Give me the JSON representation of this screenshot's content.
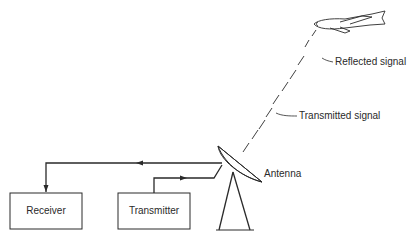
{
  "diagram": {
    "type": "radar-system",
    "blocks": [
      {
        "id": "receiver",
        "label": "Receiver"
      },
      {
        "id": "transmitter",
        "label": "Transmitter"
      }
    ],
    "labels": {
      "antenna": "Antenna",
      "reflected_signal": "Reflected signal",
      "transmitted_signal": "Transmitted signal"
    },
    "icons": [
      "aircraft-icon",
      "antenna-dish-icon"
    ],
    "colors": {
      "line": "#2a2a2a",
      "background": "#ffffff"
    }
  }
}
